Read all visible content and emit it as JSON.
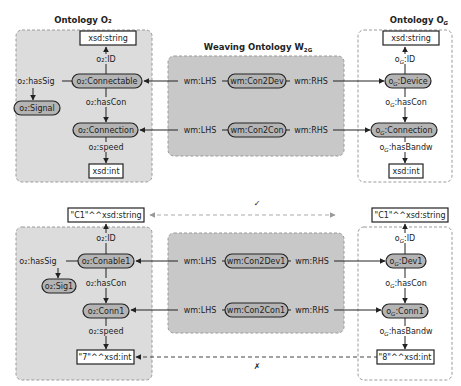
{
  "colors": {
    "panel_fill": "#dcdcdc",
    "panel_stroke": "#9a9a9a",
    "weave_fill": "#c8c8c8",
    "node_fill": "#b4b4b4",
    "node_stroke": "#222222",
    "literal_fill": "#ffffff",
    "edge": "#222222",
    "dashed_edge": "#777777",
    "dashed_edge_light": "#aaaaaa"
  },
  "titles": {
    "o2": "Ontology O₂",
    "og": "Ontology O",
    "og_sub": "G",
    "weave": "Weaving Ontology W",
    "weave_sub": "2G"
  },
  "top": {
    "o2": {
      "literal_top": "xsd:string",
      "id_label": "o₂:ID",
      "class_main": "o₂:Connectable",
      "has_sig": "o₂:hasSig",
      "signal": "o₂:Signal",
      "has_con": "o₂:hasCon",
      "connection": "o₂:Connection",
      "speed": "o₂:speed",
      "literal_bottom": "xsd:int"
    },
    "weave": {
      "row1": {
        "lhs": "wm:LHS",
        "node": "wm:Con2Dev",
        "rhs": "wm:RHS"
      },
      "row2": {
        "lhs": "wm:LHS",
        "node": "wm:Con2Con",
        "rhs": "wm:RHS"
      }
    },
    "og": {
      "literal_top": "xsd:string",
      "id_label": "o",
      "id_label_rest": ":ID",
      "device": "o",
      "device_rest": ":Device",
      "has_con": "o",
      "has_con_rest": ":hasCon",
      "connection": "o",
      "connection_rest": ":Connection",
      "has_bandw": "o",
      "has_bandw_rest": ":hasBandw",
      "literal_bottom": "xsd:int"
    }
  },
  "bottom": {
    "o2": {
      "literal_top": "\"C1\"^^xsd:string",
      "id_label": "o₂:ID",
      "class_main": "o₂:Conable1",
      "has_sig": "o₂:hasSig",
      "signal": "o₂:Sig1",
      "has_con": "o₂:hasCon",
      "connection": "o₂:Conn1",
      "speed": "o₂:speed",
      "literal_bottom": "\"7\"^^xsd:int"
    },
    "weave": {
      "row1": {
        "lhs": "wm:LHS",
        "node": "wm:Con2Dev1",
        "rhs": "wm:RHS"
      },
      "row2": {
        "lhs": "wm:LHS",
        "node": "wm:Con2Con1",
        "rhs": "wm:RHS"
      }
    },
    "og": {
      "literal_top": "\"C1\"^^xsd:string",
      "id_label": "o",
      "id_label_rest": ":ID",
      "device": "o",
      "device_rest": ":Dev1",
      "has_con": "o",
      "has_con_rest": ":hasCon",
      "connection": "o",
      "connection_rest": ":Conn1",
      "has_bandw": "o",
      "has_bandw_rest": ":hasBandw",
      "literal_bottom": "\"8\"^^xsd:int"
    },
    "match_mark": "✓",
    "mismatch_mark": "✗"
  }
}
